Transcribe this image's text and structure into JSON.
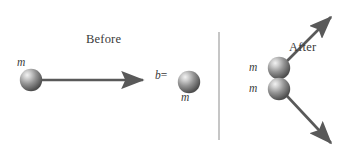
{
  "figure": {
    "width": 350,
    "height": 157,
    "background": "#ffffff",
    "ink_color": "#595959",
    "sphere_color": "#8c8c8c",
    "sphere_highlight": "#e8e8e8",
    "sphere_shadow": "#4a4a4a"
  },
  "panels": {
    "before": {
      "title": "Before",
      "divider": true
    },
    "after": {
      "title": "After"
    }
  },
  "labels": {
    "incoming_mass": "m",
    "target_mass": "m",
    "outgoing_upper_mass": "m",
    "outgoing_lower_mass": "m",
    "impact_parameter": "b =",
    "impact_parameter_symbol": "b",
    "impact_parameter_operator": "="
  },
  "objects": {
    "incoming_sphere": {
      "cx": 31,
      "cy": 80,
      "r": 11
    },
    "target_sphere": {
      "cx": 189,
      "cy": 82,
      "r": 11
    },
    "outgoing_upper_sphere": {
      "cx": 279,
      "cy": 68,
      "r": 11
    },
    "outgoing_lower_sphere": {
      "cx": 279,
      "cy": 89,
      "r": 11
    }
  },
  "arrows": {
    "incoming_velocity": {
      "x1": 42,
      "y1": 80,
      "x2": 146,
      "y2": 80,
      "direction": "right"
    },
    "outgoing_upper_velocity": {
      "x1": 288,
      "y1": 60,
      "x2": 334,
      "y2": 14,
      "direction": "up-right"
    },
    "outgoing_lower_velocity": {
      "x1": 288,
      "y1": 97,
      "x2": 334,
      "y2": 146,
      "direction": "down-right"
    }
  },
  "divider_line": {
    "x": 219,
    "y1": 32,
    "y2": 140
  }
}
